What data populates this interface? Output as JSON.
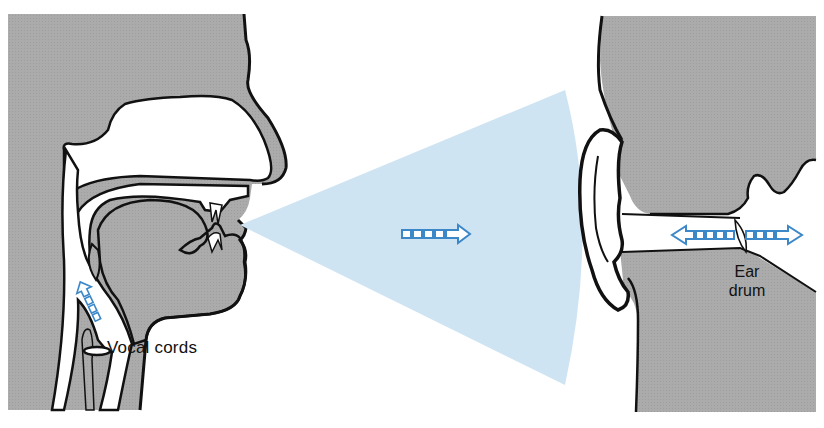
{
  "diagram": {
    "labels": {
      "vocal_cords": "Vocal cords",
      "ear_drum_line1": "Ear",
      "ear_drum_line2": "drum"
    },
    "elements": {
      "speaker_head": "Cross-section of speaker's head showing nasal cavity, mouth, tongue, throat",
      "sound_wave": "Cone of compressions and rarefactions traveling from mouth to ear",
      "listener_head": "Cross-section of listener's ear canal",
      "arrow_throat": "Air flow up from vocal cords",
      "arrow_wave": "Sound propagation direction",
      "arrow_eardrum": "Ear drum vibration (back and forth)"
    },
    "colors": {
      "tissue_gray": "#a9a9a9",
      "outline": "#111111",
      "arrow_blue": "#3b87c8",
      "wave_light_blue": "#cfe4f2",
      "wave_dots": "#333333",
      "background": "#ffffff"
    }
  }
}
